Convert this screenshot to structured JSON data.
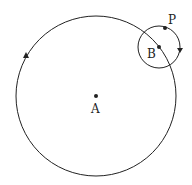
{
  "diagram": {
    "large_circle": {
      "center_label": "A",
      "cx": 96,
      "cy": 96,
      "r": 80,
      "direction": "counterclockwise"
    },
    "small_circle": {
      "center_label": "B",
      "cx": 159,
      "cy": 47,
      "r": 21,
      "direction": "clockwise"
    },
    "point_on_small_circle": {
      "label": "P",
      "x": 165,
      "y": 28
    },
    "labels": {
      "A": "A",
      "B": "B",
      "P": "P"
    },
    "stroke_color": "#222222"
  }
}
